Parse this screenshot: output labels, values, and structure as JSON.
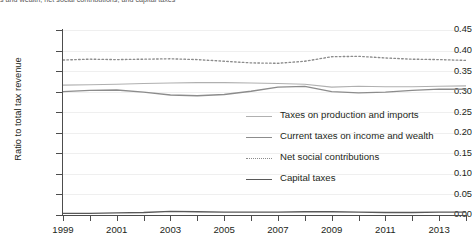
{
  "caption": "s and wealth, net social contributions, and capital taxes",
  "chart_data": {
    "type": "line",
    "title": "",
    "xlabel": "",
    "ylabel": "Ratio to total tax revenue",
    "xlim": [
      1999,
      2014
    ],
    "ylim": [
      0.0,
      0.45
    ],
    "grid": true,
    "legend_position": "center-right",
    "x": [
      1999,
      2000,
      2001,
      2002,
      2003,
      2004,
      2005,
      2006,
      2007,
      2008,
      2009,
      2010,
      2011,
      2012,
      2013,
      2014
    ],
    "y_ticks": [
      "0.00",
      "0.05",
      "0.10",
      "0.15",
      "0.20",
      "0.25",
      "0.30",
      "0.35",
      "0.40",
      "0.45"
    ],
    "y_tick_values": [
      0.0,
      0.05,
      0.1,
      0.15,
      0.2,
      0.25,
      0.3,
      0.35,
      0.4,
      0.45
    ],
    "x_ticks": [
      "1999",
      "2001",
      "2003",
      "2005",
      "2007",
      "2009",
      "2011",
      "2013"
    ],
    "x_tick_values": [
      1999,
      2001,
      2003,
      2005,
      2007,
      2009,
      2011,
      2013
    ],
    "series": [
      {
        "name": "Taxes on production and imports",
        "style": "solid",
        "color": "#b0b0b0",
        "width": 1.1,
        "values": [
          0.316,
          0.317,
          0.318,
          0.32,
          0.321,
          0.322,
          0.322,
          0.321,
          0.32,
          0.318,
          0.311,
          0.313,
          0.312,
          0.312,
          0.313,
          0.314
        ]
      },
      {
        "name": "Current taxes on income and wealth",
        "style": "solid",
        "color": "#8c8c8c",
        "width": 1.35,
        "values": [
          0.3,
          0.303,
          0.304,
          0.299,
          0.292,
          0.29,
          0.293,
          0.301,
          0.311,
          0.313,
          0.3,
          0.297,
          0.299,
          0.303,
          0.306,
          0.306
        ]
      },
      {
        "name": "Net social contributions",
        "style": "dotted",
        "color": "#8c8c8c",
        "width": 1.35,
        "values": [
          0.377,
          0.379,
          0.378,
          0.379,
          0.38,
          0.378,
          0.374,
          0.37,
          0.369,
          0.374,
          0.385,
          0.386,
          0.382,
          0.379,
          0.378,
          0.376
        ]
      },
      {
        "name": "Capital taxes",
        "style": "solid",
        "color": "#595959",
        "width": 1.35,
        "values": [
          0.004,
          0.004,
          0.005,
          0.006,
          0.009,
          0.008,
          0.007,
          0.007,
          0.007,
          0.008,
          0.008,
          0.007,
          0.006,
          0.006,
          0.007,
          0.007
        ]
      }
    ]
  }
}
